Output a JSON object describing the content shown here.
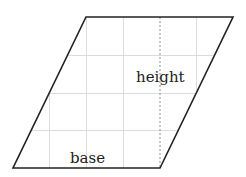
{
  "diagram": {
    "shape": "parallelogram",
    "labels": {
      "height": "height",
      "base": "base"
    },
    "colors": {
      "outline": "#222222",
      "grid": "#d9d9d9",
      "dashed": "#888888",
      "background": "#ffffff"
    },
    "vertices": {
      "top_left": [
        86,
        17
      ],
      "top_right": [
        233,
        17
      ],
      "bottom_right": [
        160,
        168
      ],
      "bottom_left": [
        13,
        168
      ]
    }
  }
}
